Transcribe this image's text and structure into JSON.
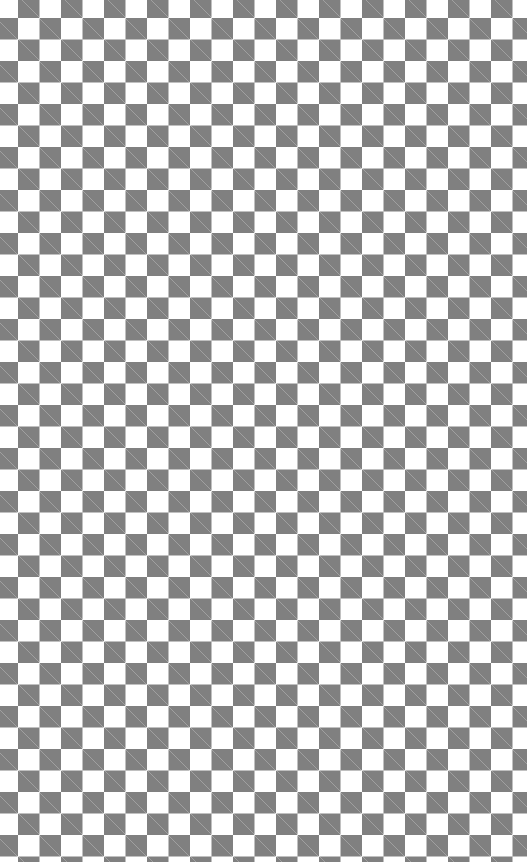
{
  "pattern": {
    "type": "checkerboard",
    "square_size_px": 21.5,
    "colors": {
      "dark": "#808080",
      "light": "#ffffff"
    },
    "label": "Transparent background checkerboard"
  }
}
